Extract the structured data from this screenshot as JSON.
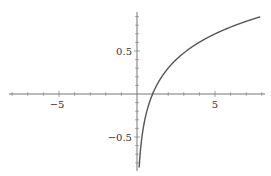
{
  "chart_data": {
    "type": "line",
    "title": "",
    "xlabel": "",
    "ylabel": "",
    "function": "log10(x)",
    "xlim": [
      -8.2,
      8.2
    ],
    "ylim": [
      -0.88,
      0.95
    ],
    "grid": false,
    "legend": null,
    "x_ticks": [
      -5,
      5
    ],
    "x_tick_labels": [
      "−5",
      "5"
    ],
    "y_ticks": [
      -0.5,
      0.5
    ],
    "y_tick_labels": [
      "−0.5",
      "0.5"
    ],
    "series": [
      {
        "name": "log10(x)",
        "color": "#555555",
        "x": [
          0.14,
          0.2,
          0.3,
          0.5,
          0.75,
          1,
          1.5,
          2,
          3,
          4,
          5,
          6,
          7,
          7.9
        ],
        "y": [
          -0.854,
          -0.699,
          -0.523,
          -0.301,
          -0.125,
          0.0,
          0.176,
          0.301,
          0.477,
          0.602,
          0.699,
          0.778,
          0.845,
          0.898
        ]
      }
    ]
  },
  "axes": {
    "x_label_minus5": "−5",
    "x_label_5": "5",
    "y_label_05": "0.5",
    "y_label_minus05": "−0.5"
  }
}
